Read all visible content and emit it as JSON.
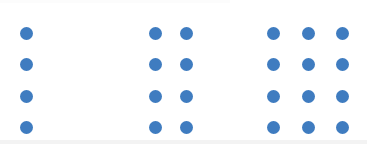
{
  "figure": {
    "canvas_width": 367,
    "canvas_height": 144,
    "background_color": "#ffffff",
    "dot_color": "#3f7cc0",
    "dot_diameter": 13,
    "row_centers_y": [
      33,
      64,
      96,
      127
    ],
    "edge_bands": {
      "bottom_color": "#f3f3f3",
      "top_color": "#fcfcfc"
    }
  },
  "chart_data": {
    "type": "scatter",
    "xlabel": "",
    "ylabel": "",
    "xlim": [
      0,
      367
    ],
    "ylim": [
      0,
      144
    ],
    "grid": false,
    "legend_position": "none",
    "marker": "circle",
    "marker_color": "#3f7cc0",
    "marker_diameter_px": 13,
    "categories": [
      "Group 1",
      "Group 2",
      "Group 3"
    ],
    "values": [
      4,
      8,
      12
    ],
    "series": [
      {
        "name": "Group 1",
        "columns": 1,
        "rows": 4,
        "count": 4,
        "column_centers_x": [
          26
        ],
        "row_centers_y": [
          33,
          64,
          96,
          127
        ]
      },
      {
        "name": "Group 2",
        "columns": 2,
        "rows": 4,
        "count": 8,
        "column_centers_x": [
          155,
          186
        ],
        "row_centers_y": [
          33,
          64,
          96,
          127
        ]
      },
      {
        "name": "Group 3",
        "columns": 3,
        "rows": 4,
        "count": 12,
        "column_centers_x": [
          273,
          308,
          342
        ],
        "row_centers_y": [
          33,
          64,
          96,
          127
        ]
      }
    ]
  }
}
